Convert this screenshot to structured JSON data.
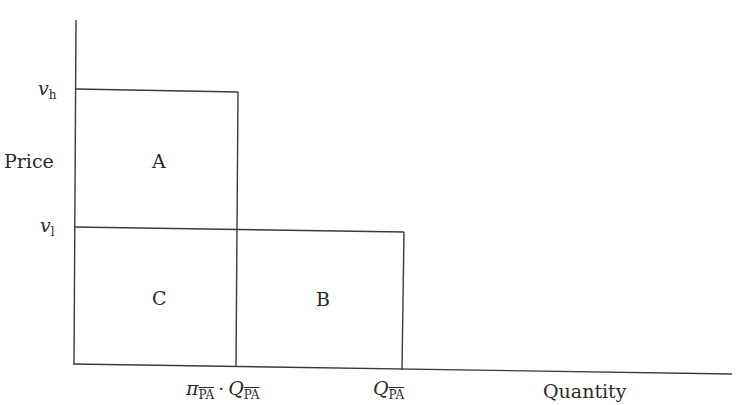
{
  "diagram": {
    "type": "price-quantity rectangles",
    "axes": {
      "y_label": "Price",
      "x_label": "Quantity"
    },
    "y_ticks": [
      {
        "symbol": "v",
        "subscript": "h"
      },
      {
        "symbol": "v",
        "subscript": "l"
      }
    ],
    "x_ticks": [
      {
        "prefix": "π",
        "prefix_sub": "PA",
        "dot": "·",
        "symbol": "Q",
        "subscript": "PA"
      },
      {
        "symbol": "Q",
        "subscript": "PA"
      }
    ],
    "regions": [
      {
        "id": "A",
        "label": "A"
      },
      {
        "id": "B",
        "label": "B"
      },
      {
        "id": "C",
        "label": "C"
      }
    ],
    "line_color": "#3a3a3a"
  }
}
